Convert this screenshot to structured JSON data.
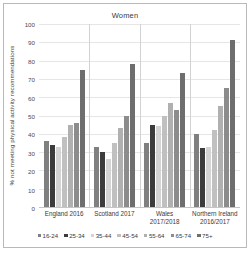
{
  "chart_data": {
    "type": "bar",
    "title": "Women",
    "xlabel": "",
    "ylabel": "% not meeting physical activity recommendations",
    "ylim": [
      0,
      100
    ],
    "ytick_step": 10,
    "yticks": [
      100,
      90,
      80,
      70,
      60,
      50,
      40,
      30,
      20,
      10,
      0
    ],
    "grid": true,
    "legend_position": "bottom",
    "categories": [
      "England 2016",
      "Scotland 2017",
      "Wales 2017/2018",
      "Northern Ireland 2016/2017"
    ],
    "category_lines": [
      [
        "England 2016"
      ],
      [
        "Scotland 2017"
      ],
      [
        "Wales",
        "2017/2018"
      ],
      [
        "Northern Ireland",
        "2016/2017"
      ]
    ],
    "series": [
      {
        "name": "16-24",
        "color": "#808080",
        "values": [
          36,
          33,
          35,
          40
        ]
      },
      {
        "name": "25-34",
        "color": "#3c3c3c",
        "values": [
          34,
          30,
          45,
          32
        ]
      },
      {
        "name": "35-44",
        "color": "#d4d4d4",
        "values": [
          33,
          26,
          44,
          33
        ]
      },
      {
        "name": "45-54",
        "color": "#c0c0c0",
        "values": [
          38,
          35,
          50,
          42
        ]
      },
      {
        "name": "55-64",
        "color": "#b0b0b0",
        "values": [
          45,
          43,
          57,
          55
        ]
      },
      {
        "name": "65-74",
        "color": "#8c8c8c",
        "values": [
          46,
          50,
          53,
          65
        ]
      },
      {
        "name": "75+",
        "color": "#6e6e6e",
        "values": [
          75,
          78,
          73,
          91
        ]
      }
    ]
  }
}
